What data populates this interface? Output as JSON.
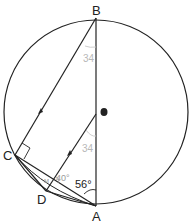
{
  "diagram": {
    "type": "circle-geometry",
    "points": {
      "A": {
        "label": "A",
        "x": 96,
        "y": 206
      },
      "B": {
        "label": "B",
        "x": 96,
        "y": 18
      },
      "C": {
        "label": "C",
        "x": 15,
        "y": 155
      },
      "D": {
        "label": "D",
        "x": 46,
        "y": 191
      },
      "O": {
        "label": "",
        "x": 104,
        "y": 112
      }
    },
    "circle": {
      "cx": 96,
      "cy": 112,
      "r": 92
    },
    "angles": {
      "BAD": "56°",
      "ADE": "40°",
      "CBA_faint": "34",
      "DEA_faint": "34",
      "CDE_tiny": "M"
    },
    "notes": {
      "right_angle_at": "C",
      "parallel_lines": [
        "BC",
        "DE"
      ]
    },
    "colors": {
      "line": "#222222",
      "faint": "#b8b8b8"
    }
  }
}
